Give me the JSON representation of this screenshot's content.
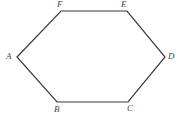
{
  "figure": {
    "kind": "hexagon-diagram",
    "canvas": {
      "width": 180,
      "height": 118,
      "background": "#ffffff"
    },
    "style": {
      "stroke_color": "#3a3a42",
      "stroke_width": 1.2,
      "fill": "none",
      "label_color": "#43434b",
      "label_font_size": 9,
      "label_style": "italic"
    },
    "vertices": [
      {
        "id": "A",
        "label": "A",
        "x": 17,
        "y": 57,
        "label_position": "left"
      },
      {
        "id": "B",
        "label": "B",
        "x": 57,
        "y": 102,
        "label_position": "below"
      },
      {
        "id": "C",
        "label": "C",
        "x": 128,
        "y": 102,
        "label_position": "below-right"
      },
      {
        "id": "D",
        "label": "D",
        "x": 165,
        "y": 57,
        "label_position": "right"
      },
      {
        "id": "E",
        "label": "E",
        "x": 127,
        "y": 11,
        "label_position": "above-left"
      },
      {
        "id": "F",
        "label": "F",
        "x": 61,
        "y": 11,
        "label_position": "above"
      }
    ],
    "edges": [
      {
        "from": "A",
        "to": "F"
      },
      {
        "from": "F",
        "to": "E"
      },
      {
        "from": "E",
        "to": "D"
      },
      {
        "from": "D",
        "to": "C"
      },
      {
        "from": "C",
        "to": "B"
      },
      {
        "from": "B",
        "to": "A"
      }
    ],
    "polygon_points": "17,57 61,11 127,11 165,57 128,102 57,102"
  }
}
